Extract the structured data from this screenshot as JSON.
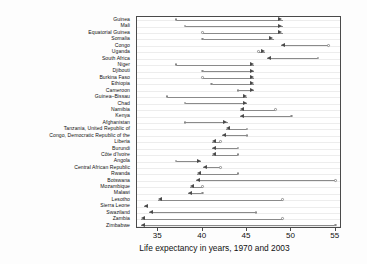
{
  "chart_data": {
    "type": "scatter",
    "title": "",
    "xlabel": "Life expectancy in years, 1970 and 2003",
    "ylabel": "",
    "xlim": [
      32.6,
      55.7
    ],
    "xticks": [
      35,
      40,
      45,
      50,
      55
    ],
    "xticklabels": [
      "35",
      "40",
      "45",
      "50",
      "55"
    ],
    "grid": true,
    "grid_orientation": "horizontal",
    "legend": "none",
    "annotation": "Arrow runs from the 1970 value (open circle) to the 2003 value (arrow head); rightward arrows indicate gains, leftward arrows indicate losses.",
    "series": [
      {
        "name": "1970",
        "marker": "open-circle"
      },
      {
        "name": "2003",
        "marker": "arrow-head"
      }
    ],
    "categories": [
      "Guinea",
      "Mali",
      "Equatorial Guinea",
      "Somalia",
      "Congo",
      "Uganda",
      "South Africa",
      "Niger",
      "Djibouti",
      "Burkina Faso",
      "Ethiopia",
      "Cameroon",
      "Guinea–Bissau",
      "Chad",
      "Namibia",
      "Kenya",
      "Afghanistan",
      "Tanzania, United Republic of",
      "Congo, Democratic Republic of the",
      "Liberia",
      "Burundi",
      "Côte d'Ivoire",
      "Angola",
      "Central African Republic",
      "Rwanda",
      "Botswana",
      "Mozambique",
      "Malawi",
      "Lesotho",
      "Sierra Leone",
      "Swaziland",
      "Zambia",
      "Zimbabwe"
    ],
    "points": [
      {
        "country": "Guinea",
        "y1970": 37.0,
        "y2003": 49.0,
        "direction": "right"
      },
      {
        "country": "Mali",
        "y1970": 38.0,
        "y2003": 49.0,
        "direction": "right"
      },
      {
        "country": "Equatorial Guinea",
        "y1970": 40.0,
        "y2003": 49.0,
        "direction": "right"
      },
      {
        "country": "Somalia",
        "y1970": 40.0,
        "y2003": 48.0,
        "direction": "right"
      },
      {
        "country": "Congo",
        "y1970": 54.2,
        "y2003": 48.8,
        "direction": "left"
      },
      {
        "country": "Uganda",
        "y1970": 46.3,
        "y2003": 47.0,
        "direction": "right"
      },
      {
        "country": "South Africa",
        "y1970": 53.0,
        "y2003": 47.2,
        "direction": "left"
      },
      {
        "country": "Niger",
        "y1970": 37.0,
        "y2003": 45.8,
        "direction": "right"
      },
      {
        "country": "Djibouti",
        "y1970": 40.0,
        "y2003": 45.8,
        "direction": "right"
      },
      {
        "country": "Burkina Faso",
        "y1970": 40.0,
        "y2003": 45.8,
        "direction": "right"
      },
      {
        "country": "Ethiopia",
        "y1970": 41.0,
        "y2003": 45.8,
        "direction": "right"
      },
      {
        "country": "Cameroon",
        "y1970": 44.0,
        "y2003": 45.8,
        "direction": "right"
      },
      {
        "country": "Guinea–Bissau",
        "y1970": 36.0,
        "y2003": 45.0,
        "direction": "right"
      },
      {
        "country": "Chad",
        "y1970": 38.0,
        "y2003": 45.0,
        "direction": "right"
      },
      {
        "country": "Namibia",
        "y1970": 48.2,
        "y2003": 44.2,
        "direction": "left"
      },
      {
        "country": "Kenya",
        "y1970": 50.0,
        "y2003": 44.2,
        "direction": "left"
      },
      {
        "country": "Afghanistan",
        "y1970": 38.0,
        "y2003": 42.8,
        "direction": "right"
      },
      {
        "country": "Tanzania, United Republic of",
        "y1970": 45.0,
        "y2003": 42.6,
        "direction": "left"
      },
      {
        "country": "Congo, Democratic Republic of the",
        "y1970": 45.0,
        "y2003": 42.2,
        "direction": "left"
      },
      {
        "country": "Liberia",
        "y1970": 42.0,
        "y2003": 41.0,
        "direction": "left"
      },
      {
        "country": "Burundi",
        "y1970": 44.0,
        "y2003": 41.0,
        "direction": "left"
      },
      {
        "country": "Côte d'Ivoire",
        "y1970": 44.0,
        "y2003": 41.0,
        "direction": "left"
      },
      {
        "country": "Angola",
        "y1970": 37.0,
        "y2003": 39.8,
        "direction": "right"
      },
      {
        "country": "Central African Republic",
        "y1970": 42.0,
        "y2003": 40.0,
        "direction": "left"
      },
      {
        "country": "Rwanda",
        "y1970": 44.0,
        "y2003": 39.4,
        "direction": "left"
      },
      {
        "country": "Botswana",
        "y1970": 55.0,
        "y2003": 39.2,
        "direction": "left"
      },
      {
        "country": "Mozambique",
        "y1970": 40.0,
        "y2003": 38.6,
        "direction": "left"
      },
      {
        "country": "Malawi",
        "y1970": 40.0,
        "y2003": 38.4,
        "direction": "left"
      },
      {
        "country": "Lesotho",
        "y1970": 49.0,
        "y2003": 35.0,
        "direction": "left"
      },
      {
        "country": "Sierra Leone",
        "y1970": 33.6,
        "y2003": 33.4,
        "direction": "left"
      },
      {
        "country": "Swaziland",
        "y1970": 46.0,
        "y2003": 34.0,
        "direction": "left"
      },
      {
        "country": "Zambia",
        "y1970": 49.0,
        "y2003": 33.0,
        "direction": "left"
      },
      {
        "country": "Zimbabwe",
        "y1970": 55.0,
        "y2003": 33.0,
        "direction": "left"
      }
    ]
  }
}
